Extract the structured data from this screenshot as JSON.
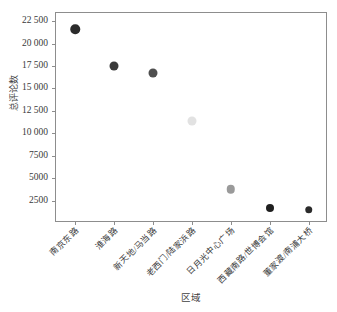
{
  "chart_data": {
    "type": "scatter",
    "title": "",
    "xlabel": "区域",
    "ylabel": "总评论数",
    "categories": [
      "南京东路",
      "淮海路",
      "新天地/马当路",
      "老西门/陆家浜路",
      "日月光中心广场",
      "西藏南路/世博会馆",
      "董家渡/南浦大桥"
    ],
    "values": [
      21600,
      17500,
      16700,
      11350,
      3750,
      1700,
      1500
    ],
    "point_colors": [
      "#2b2b2b",
      "#3a3a3a",
      "#4f4f4f",
      "#e2e2e2",
      "#9a9a9a",
      "#1f1f1f",
      "#2b2b2b"
    ],
    "point_sizes": [
      9.5,
      9,
      9,
      9,
      8.5,
      8,
      7.5
    ],
    "ylim": [
      0,
      23400
    ],
    "xlim": [
      0,
      7
    ],
    "grid": false,
    "legend": "none",
    "y_ticks": [
      2500,
      5000,
      7500,
      10000,
      12500,
      15000,
      17500,
      20000,
      22500
    ],
    "y_tick_labels": [
      "2500",
      "5000",
      "7500",
      "10 000",
      "12 500",
      "15 000",
      "17 500",
      "20 000",
      "22 500"
    ]
  },
  "axes": {
    "frame_color": "#8d8d8d",
    "background": "#ffffff"
  }
}
